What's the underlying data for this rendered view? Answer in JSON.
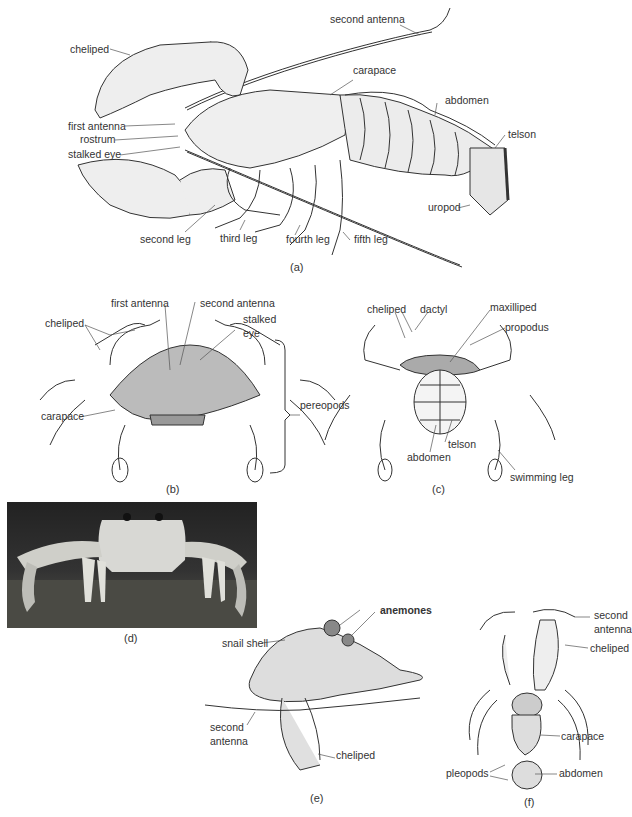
{
  "panels": {
    "a": {
      "caption": "(a)",
      "subject": "lobster",
      "labels": {
        "second_antenna": "second antenna",
        "cheliped": "cheliped",
        "carapace": "carapace",
        "abdomen": "abdomen",
        "first_antenna": "first antenna",
        "rostrum": "rostrum",
        "stalked_eye": "stalked eye",
        "telson": "telson",
        "uropod": "uropod",
        "second_leg": "second leg",
        "third_leg": "third leg",
        "fourth_leg": "fourth leg",
        "fifth_leg": "fifth leg"
      }
    },
    "b": {
      "caption": "(b)",
      "subject": "crab dorsal view",
      "labels": {
        "first_antenna": "first antenna",
        "second_antenna": "second antenna",
        "cheliped": "cheliped",
        "stalked": "stalked",
        "eye": "eye",
        "carapace": "carapace",
        "pereopods": "pereopods"
      }
    },
    "c": {
      "caption": "(c)",
      "subject": "crab ventral view",
      "labels": {
        "cheliped": "cheliped",
        "dactyl": "dactyl",
        "maxilliped": "maxilliped",
        "propodus": "propodus",
        "telson": "telson",
        "abdomen": "abdomen",
        "swimming_leg": "swimming leg"
      }
    },
    "d": {
      "caption": "(d)",
      "subject": "ghost crab photograph"
    },
    "e": {
      "caption": "(e)",
      "subject": "hermit crab in shell",
      "labels": {
        "anemones": "anemones",
        "snail_shell": "snail shell",
        "second": "second",
        "antenna": "antenna",
        "cheliped": "cheliped"
      }
    },
    "f": {
      "caption": "(f)",
      "subject": "hermit crab out of shell",
      "labels": {
        "second": "second",
        "antenna": "antenna",
        "cheliped": "cheliped",
        "carapace": "carapace",
        "abdomen": "abdomen",
        "pleopods": "pleopods"
      }
    }
  }
}
